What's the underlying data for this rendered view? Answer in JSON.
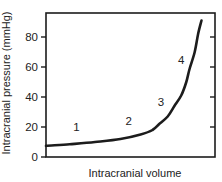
{
  "style": {
    "ink": "#1c1c1c",
    "text_color": "#222222",
    "background": "#ffffff"
  },
  "chart_data": {
    "type": "line",
    "title": "",
    "xlabel": "Intracranial volume",
    "ylabel": "Intracranial pressure (mmHg)",
    "xlim": [
      0,
      100
    ],
    "ylim": [
      0,
      96
    ],
    "yticks": [
      0,
      20,
      40,
      60,
      80
    ],
    "xticks": [],
    "grid": false,
    "legend": "none",
    "plot_box": "full frame with mirrored right-side ticks",
    "series": [
      {
        "name": "intracranial pressure-volume curve",
        "x": [
          0,
          14,
          29,
          44,
          56,
          63,
          67,
          72,
          76,
          80,
          83,
          85,
          88,
          90,
          92
        ],
        "y": [
          7.5,
          8.5,
          10,
          12,
          15,
          18,
          22,
          27,
          34,
          41,
          50,
          59,
          70,
          82,
          91
        ]
      }
    ],
    "annotations": [
      {
        "label": "1",
        "x": 18,
        "y": 20
      },
      {
        "label": "2",
        "x": 49,
        "y": 24
      },
      {
        "label": "3",
        "x": 68,
        "y": 37
      },
      {
        "label": "4",
        "x": 80,
        "y": 65
      }
    ]
  }
}
